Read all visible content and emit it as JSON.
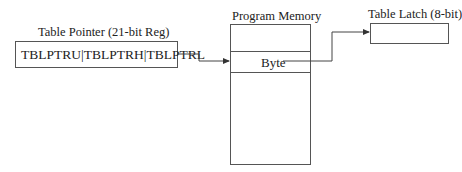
{
  "diagram": {
    "table_pointer": {
      "title": "Table Pointer (21-bit Reg)",
      "content": "TBLPTRU|TBLPTRH|TBLPTRL"
    },
    "program_memory": {
      "title": "Program Memory",
      "cell_label": "Byte"
    },
    "table_latch": {
      "title": "Table Latch (8-bit)"
    },
    "connections": [
      {
        "from": "table_pointer",
        "to": "program_memory.byte"
      },
      {
        "from": "program_memory.byte",
        "to": "table_latch"
      }
    ]
  }
}
